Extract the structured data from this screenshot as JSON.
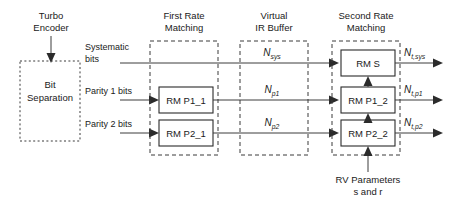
{
  "diagram": {
    "type": "block-diagram",
    "colors": {
      "line": "#3c3c3c",
      "box_stroke": "#2b2b2b",
      "group_stroke": "#3a3a3a",
      "text": "#1a1a1a",
      "background": "#ffffff"
    }
  },
  "headers": {
    "turbo_encoder": {
      "line1": "Turbo",
      "line2": "Encoder"
    },
    "first_rate_matching": {
      "line1": "First Rate",
      "line2": "Matching"
    },
    "virtual_ir_buffer": {
      "line1": "Virtual",
      "line2": "IR Buffer"
    },
    "second_rate_matching": {
      "line1": "Second Rate",
      "line2": "Matching"
    }
  },
  "groups": {
    "bit_separation": {
      "line1": "Bit",
      "line2": "Separation",
      "style": "dotted"
    },
    "first_rate_matching": {
      "style": "dashed"
    },
    "virtual_ir_buffer": {
      "style": "dashed"
    },
    "second_rate_matching": {
      "style": "dashed"
    }
  },
  "signals": {
    "systematic": {
      "line1": "Systematic",
      "line2": "bits"
    },
    "parity1": {
      "label": "Parity 1 bits"
    },
    "parity2": {
      "label": "Parity 2 bits"
    }
  },
  "first_stage_blocks": [
    {
      "label": "RM P1_1"
    },
    {
      "label": "RM P2_1"
    }
  ],
  "buffer_labels": [
    {
      "base": "N",
      "sub": "sys"
    },
    {
      "base": "N",
      "sub": "p1"
    },
    {
      "base": "N",
      "sub": "p2"
    }
  ],
  "second_stage_blocks": [
    {
      "label": "RM S"
    },
    {
      "label": "RM P1_2"
    },
    {
      "label": "RM P2_2"
    }
  ],
  "outputs": [
    {
      "base": "N",
      "sub": "t,sys"
    },
    {
      "base": "N",
      "sub": "t,p1"
    },
    {
      "base": "N",
      "sub": "t,p2"
    }
  ],
  "rv_parameters": {
    "line1": "RV Parameters",
    "line2": "s and r"
  }
}
